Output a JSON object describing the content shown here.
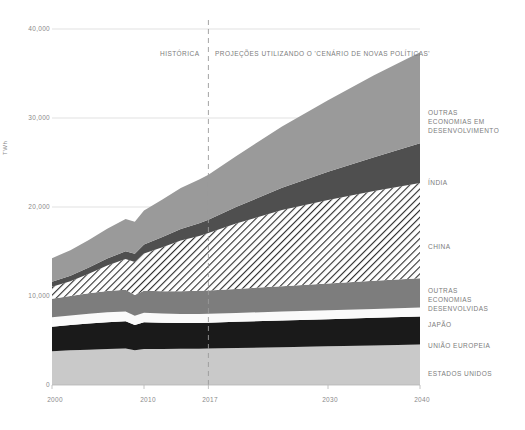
{
  "chart_data": {
    "type": "area",
    "stacked": true,
    "title": "",
    "xlabel": "",
    "ylabel": "TWh",
    "xlim": [
      2000,
      2040
    ],
    "ylim": [
      0,
      40000
    ],
    "grid": true,
    "legend_position": "right",
    "x_ticks": [
      "2000",
      "2010",
      "2017",
      "2030",
      "2040"
    ],
    "x_tick_values": [
      2000,
      2010,
      2017,
      2030,
      2040
    ],
    "y_ticks": [
      "0",
      "10,000",
      "20,000",
      "30,000",
      "40,000"
    ],
    "y_tick_values": [
      0,
      10000,
      20000,
      30000,
      40000
    ],
    "x": [
      2000,
      2002,
      2004,
      2006,
      2008,
      2009,
      2010,
      2012,
      2014,
      2016,
      2017,
      2020,
      2025,
      2030,
      2035,
      2040
    ],
    "annotations": [
      {
        "text": "HISTÓRICA",
        "x": 2014,
        "y": 37000
      },
      {
        "text": "PROJEÇÕES UTILIZANDO O 'CENÁRIO DE NOVAS POLÍTICAS'",
        "x": 2018,
        "y": 37000
      }
    ],
    "divider": {
      "x": 2017,
      "style": "dashed",
      "label_left": "HISTÓRICA",
      "label_right": "PROJEÇÕES UTILIZANDO O 'CENÁRIO DE NOVAS POLÍTICAS'"
    },
    "series": [
      {
        "name": "ESTADOS UNIDOS",
        "color": "#c9c9c9",
        "pattern": "solid",
        "values": [
          3800,
          3900,
          3950,
          4050,
          4100,
          3900,
          4050,
          4050,
          4080,
          4080,
          4100,
          4150,
          4250,
          4350,
          4450,
          4550
        ]
      },
      {
        "name": "UNIÃO EUROPEIA",
        "color": "#1a1a1a",
        "pattern": "solid",
        "values": [
          2750,
          2850,
          2950,
          3000,
          3050,
          2850,
          3000,
          2950,
          2900,
          2900,
          2900,
          2950,
          3000,
          3050,
          3100,
          3150
        ]
      },
      {
        "name": "JAPÃO",
        "color": "#fafafa",
        "pattern": "solid",
        "values": [
          1050,
          1060,
          1100,
          1120,
          1100,
          1020,
          1080,
          1030,
          1000,
          1000,
          1000,
          1000,
          1000,
          1000,
          1000,
          1000
        ]
      },
      {
        "name": "OUTRAS ECONOMIAS DESENVOLVIDAS",
        "color": "#7d7d7d",
        "pattern": "solid",
        "values": [
          2100,
          2200,
          2300,
          2400,
          2450,
          2350,
          2450,
          2500,
          2550,
          2600,
          2620,
          2700,
          2850,
          3000,
          3150,
          3300
        ]
      },
      {
        "name": "CHINA",
        "color": "#ffffff",
        "pattern": "diagonal-hatch",
        "values": [
          1350,
          1650,
          2200,
          2850,
          3450,
          3700,
          4200,
          4950,
          5700,
          6150,
          6450,
          7350,
          8550,
          9400,
          10100,
          10700
        ]
      },
      {
        "name": "ÍNDIA",
        "color": "#4f4f4f",
        "pattern": "solid",
        "values": [
          560,
          620,
          700,
          780,
          880,
          930,
          1000,
          1150,
          1300,
          1450,
          1500,
          1850,
          2500,
          3150,
          3800,
          4450
        ]
      },
      {
        "name": "OUTRAS ECONOMIAS EM DESENVOLVIMENTO",
        "color": "#9a9a9a",
        "pattern": "solid",
        "values": [
          2640,
          2870,
          3100,
          3350,
          3620,
          3600,
          3820,
          4220,
          4600,
          4900,
          5050,
          5700,
          6900,
          8050,
          9200,
          10250
        ]
      }
    ],
    "totals": [
      14250,
      15150,
      16300,
      17550,
      18650,
      18350,
      19600,
      20850,
      22130,
      23080,
      23620,
      25700,
      29050,
      32000,
      34800,
      37400
    ]
  },
  "legend": {
    "items": [
      {
        "label": "OUTRAS\nECONOMIAS EM\nDESENVOLVIMENTO",
        "top": 108
      },
      {
        "label": "ÍNDIA",
        "top": 178
      },
      {
        "label": "CHINA",
        "top": 242
      },
      {
        "label": "OUTRAS\nECONOMIAS\nDESENVOLVIDAS",
        "top": 286
      },
      {
        "label": "JAPÃO",
        "top": 320
      },
      {
        "label": "UNIÃO EUROPEIA",
        "top": 341
      },
      {
        "label": "ESTADOS UNIDOS",
        "top": 369
      }
    ]
  },
  "axis": {
    "y_label": "TWh",
    "y_ticks": [
      {
        "label": "40,000",
        "top": 25
      },
      {
        "label": "30,000",
        "top": 114
      },
      {
        "label": "20,000",
        "top": 203
      },
      {
        "label": "10,000",
        "top": 292
      },
      {
        "label": "0",
        "top": 381
      }
    ],
    "x_ticks": [
      {
        "label": "2000",
        "left": 35
      },
      {
        "label": "2010",
        "left": 128
      },
      {
        "label": "2017",
        "left": 190
      },
      {
        "label": "2030",
        "left": 310
      },
      {
        "label": "2040",
        "left": 402
      }
    ]
  },
  "annotations": {
    "historica": "HISTÓRICA",
    "projecoes": "PROJEÇÕES UTILIZANDO O 'CENÁRIO DE NOVAS POLÍTICAS'"
  },
  "colors": {
    "background": "#ffffff",
    "grid": "#d9d9d9",
    "text": "#7c7c7c",
    "divider": "#9a9a9a"
  }
}
